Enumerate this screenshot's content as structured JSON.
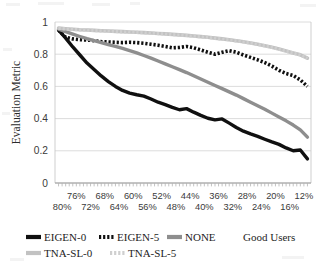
{
  "chart_data": {
    "type": "line",
    "title": "",
    "xlabel": "Good Users",
    "ylabel": "Evaluation Metric",
    "ylim": [
      0,
      1
    ],
    "yticks": [
      "0",
      "0.2",
      "0.4",
      "0.6",
      "0.8",
      "1"
    ],
    "ytick_values": [
      0,
      0.2,
      0.4,
      0.6,
      0.8,
      1
    ],
    "grid": true,
    "grid_axis": "y",
    "legend_position": "bottom",
    "xlim_percent": [
      82,
      10
    ],
    "x_axis_direction": "descending",
    "xtick_labels_row1": [
      "76%",
      "68%",
      "60%",
      "52%",
      "44%",
      "36%",
      "28%",
      "20%",
      "12%"
    ],
    "xtick_labels_row2": [
      "80%",
      "72%",
      "64%",
      "56%",
      "48%",
      "40%",
      "32%",
      "24%",
      "16%"
    ],
    "xtick_values_row1": [
      76,
      68,
      60,
      52,
      44,
      36,
      28,
      20,
      12
    ],
    "xtick_values_row2": [
      80,
      72,
      64,
      56,
      48,
      40,
      32,
      24,
      16
    ],
    "x": [
      81,
      79,
      77,
      75,
      73,
      71,
      69,
      67,
      65,
      63,
      61,
      59,
      57,
      55,
      53,
      51,
      49,
      47,
      45,
      43,
      41,
      39,
      37,
      35,
      33,
      31,
      29,
      27,
      25,
      23,
      21,
      19,
      17,
      15,
      13,
      11
    ],
    "series": [
      {
        "name": "EIGEN-0",
        "color": "#101010",
        "style": "solid",
        "width": 3.4,
        "values": [
          0.95,
          0.9,
          0.845,
          0.795,
          0.745,
          0.705,
          0.665,
          0.63,
          0.6,
          0.575,
          0.558,
          0.548,
          0.54,
          0.522,
          0.502,
          0.487,
          0.47,
          0.455,
          0.462,
          0.44,
          0.42,
          0.402,
          0.392,
          0.398,
          0.372,
          0.345,
          0.322,
          0.305,
          0.29,
          0.272,
          0.255,
          0.24,
          0.218,
          0.2,
          0.205,
          0.15
        ]
      },
      {
        "name": "EIGEN-5",
        "color": "#101010",
        "style": "dotted",
        "width": 3.6,
        "values": [
          0.95,
          0.905,
          0.895,
          0.89,
          0.888,
          0.884,
          0.878,
          0.876,
          0.874,
          0.872,
          0.874,
          0.872,
          0.868,
          0.862,
          0.856,
          0.848,
          0.84,
          0.842,
          0.848,
          0.84,
          0.826,
          0.812,
          0.8,
          0.812,
          0.822,
          0.812,
          0.795,
          0.78,
          0.765,
          0.748,
          0.726,
          0.7,
          0.68,
          0.668,
          0.64,
          0.6
        ]
      },
      {
        "name": "NONE",
        "color": "#8e8e8e",
        "style": "solid",
        "width": 3.4,
        "values": [
          0.955,
          0.94,
          0.925,
          0.91,
          0.896,
          0.884,
          0.872,
          0.86,
          0.848,
          0.836,
          0.822,
          0.808,
          0.792,
          0.776,
          0.758,
          0.74,
          0.722,
          0.704,
          0.686,
          0.666,
          0.646,
          0.626,
          0.606,
          0.586,
          0.566,
          0.546,
          0.524,
          0.502,
          0.48,
          0.458,
          0.434,
          0.41,
          0.386,
          0.36,
          0.33,
          0.285
        ]
      },
      {
        "name": "TNA-SL-0",
        "color": "#c2c2c2",
        "style": "solid",
        "width": 3.6,
        "values": [
          0.962,
          0.958,
          0.955,
          0.952,
          0.95,
          0.948,
          0.946,
          0.944,
          0.942,
          0.94,
          0.938,
          0.936,
          0.934,
          0.932,
          0.929,
          0.926,
          0.923,
          0.92,
          0.917,
          0.913,
          0.909,
          0.905,
          0.9,
          0.895,
          0.89,
          0.884,
          0.877,
          0.87,
          0.862,
          0.853,
          0.843,
          0.832,
          0.82,
          0.808,
          0.796,
          0.775
        ]
      },
      {
        "name": "TNA-SL-5",
        "color": "#cfcfcf",
        "style": "dotted",
        "width": 3.2,
        "values": [
          0.961,
          0.957,
          0.954,
          0.951,
          0.949,
          0.947,
          0.945,
          0.943,
          0.941,
          0.939,
          0.937,
          0.935,
          0.933,
          0.931,
          0.928,
          0.925,
          0.922,
          0.919,
          0.916,
          0.912,
          0.908,
          0.904,
          0.899,
          0.894,
          0.889,
          0.883,
          0.876,
          0.869,
          0.861,
          0.852,
          0.842,
          0.831,
          0.819,
          0.807,
          0.795,
          0.774
        ]
      }
    ],
    "legend": [
      {
        "label": "EIGEN-0",
        "color": "#101010",
        "style": "solid"
      },
      {
        "label": "EIGEN-5",
        "color": "#101010",
        "style": "dotted"
      },
      {
        "label": "NONE",
        "color": "#8e8e8e",
        "style": "solid"
      },
      {
        "label": "TNA-SL-0",
        "color": "#c2c2c2",
        "style": "solid"
      },
      {
        "label": "TNA-SL-5",
        "color": "#cfcfcf",
        "style": "dotted"
      }
    ]
  },
  "colors": {
    "background": "#ffffff",
    "grid": "#d8d8d8",
    "axis": "#c9c9c9",
    "text": "#1d1d1d"
  }
}
